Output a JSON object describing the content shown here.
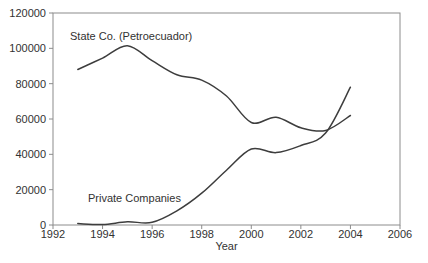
{
  "figure": {
    "background": "#ffffff",
    "frame_color": "#8c8c8c",
    "line_color": "#3d3d3d",
    "text_color": "#323232"
  },
  "chart_data": {
    "type": "line",
    "title": "",
    "xlabel": "Year",
    "ylabel": "",
    "xlim": [
      1992,
      2006
    ],
    "ylim": [
      0,
      120000
    ],
    "x_ticks": [
      1992,
      1994,
      1996,
      1998,
      2000,
      2002,
      2004,
      2006
    ],
    "y_ticks": [
      0,
      20000,
      40000,
      60000,
      80000,
      100000,
      120000
    ],
    "grid": false,
    "legend_position": "inline-annotations",
    "x": [
      1993,
      1994,
      1995,
      1996,
      1997,
      1998,
      1999,
      2000,
      2001,
      2002,
      2003,
      2004
    ],
    "series": [
      {
        "name": "State Co. (Petroecuador)",
        "values": [
          88000,
          94500,
          101500,
          93000,
          85000,
          82000,
          73000,
          58000,
          61000,
          55000,
          53500,
          62000
        ]
      },
      {
        "name": "Private Companies",
        "values": [
          800,
          300,
          1800,
          1500,
          8000,
          18000,
          31000,
          43000,
          41000,
          45000,
          52000,
          78000
        ]
      }
    ],
    "annotations": [
      {
        "text": "State Co. (Petroecuador)",
        "x_px": 70,
        "y_px": 40
      },
      {
        "text": "Private Companies",
        "x_px": 88,
        "y_px": 202
      }
    ]
  }
}
